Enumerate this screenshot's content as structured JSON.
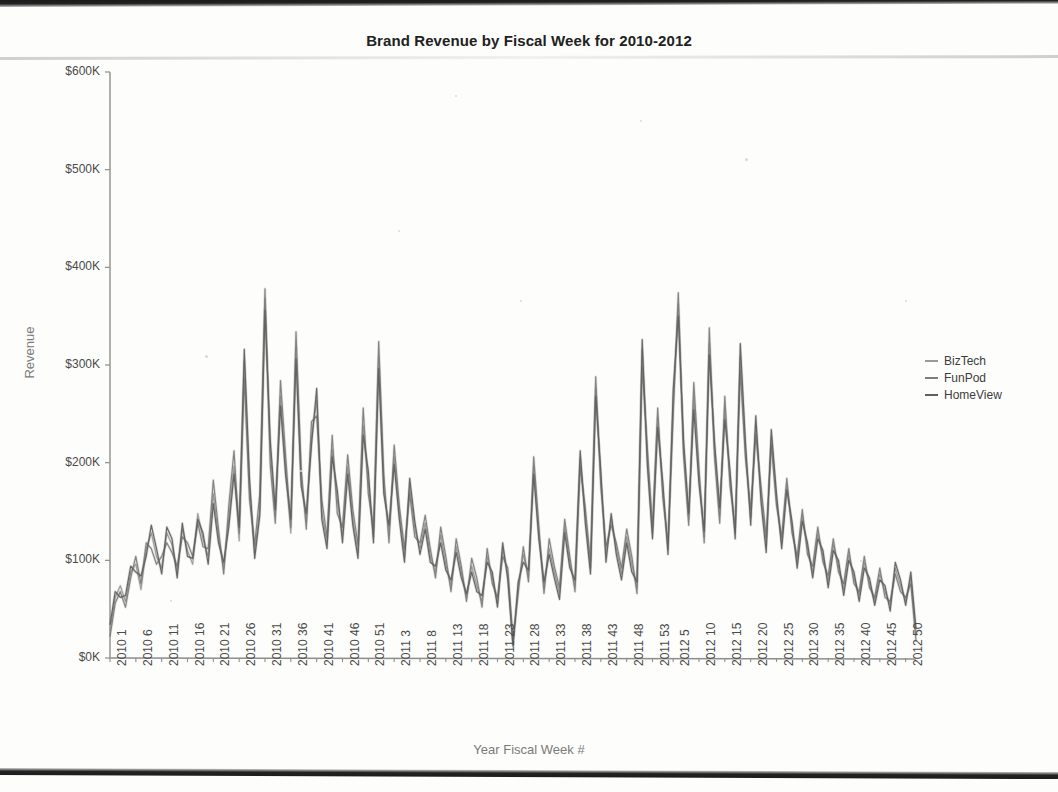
{
  "chart_data": {
    "type": "line",
    "title": "Brand Revenue by Fiscal Week for 2010-2012",
    "xlabel": "Year Fiscal Week #",
    "ylabel": "Revenue",
    "ylim": [
      0,
      600000
    ],
    "ytick_labels": [
      "$600K",
      "$500K",
      "$400K",
      "$300K",
      "$200K",
      "$100K",
      "$0K"
    ],
    "ytick_values": [
      600000,
      500000,
      400000,
      300000,
      200000,
      100000,
      0
    ],
    "grid": false,
    "legend_position": "right",
    "xtick_labels": [
      "2010 1",
      "2010 6",
      "2010 11",
      "2010 16",
      "2010 21",
      "2010 26",
      "2010 31",
      "2010 36",
      "2010 41",
      "2010 46",
      "2010 51",
      "2011 3",
      "2011 8",
      "2011 13",
      "2011 18",
      "2011 23",
      "2011 28",
      "2011 33",
      "2011 38",
      "2011 43",
      "2011 48",
      "2011 53",
      "2012 5",
      "2012 10",
      "2012 15",
      "2012 20",
      "2012 25",
      "2012 30",
      "2012 35",
      "2012 40",
      "2012 45",
      "2012 50"
    ],
    "xtick_indices": [
      0,
      5,
      10,
      15,
      20,
      25,
      30,
      35,
      40,
      45,
      50,
      55,
      60,
      65,
      70,
      75,
      80,
      85,
      90,
      95,
      100,
      105,
      109,
      114,
      119,
      124,
      129,
      134,
      139,
      144,
      149,
      154
    ],
    "n_points": 157,
    "series": [
      {
        "name": "BizTech",
        "color": "#9a9a9a",
        "values": [
          28000,
          62000,
          74000,
          58000,
          88000,
          96000,
          70000,
          112000,
          128000,
          104000,
          92000,
          128000,
          116000,
          88000,
          132000,
          110000,
          96000,
          148000,
          122000,
          104000,
          168000,
          124000,
          92000,
          142000,
          196000,
          120000,
          304000,
          176000,
          108000,
          152000,
          368000,
          214000,
          146000,
          268000,
          194000,
          128000,
          318000,
          182000,
          140000,
          226000,
          264000,
          150000,
          118000,
          214000,
          162000,
          126000,
          196000,
          142000,
          108000,
          238000,
          180000,
          124000,
          308000,
          176000,
          128000,
          206000,
          148000,
          104000,
          176000,
          132000,
          112000,
          138000,
          104000,
          88000,
          126000,
          96000,
          74000,
          114000,
          88000,
          62000,
          94000,
          74000,
          58000,
          104000,
          82000,
          56000,
          112000,
          86000,
          14000,
          72000,
          106000,
          84000,
          196000,
          128000,
          72000,
          112000,
          88000,
          66000,
          134000,
          98000,
          74000,
          204000,
          146000,
          92000,
          276000,
          184000,
          106000,
          142000,
          112000,
          86000,
          124000,
          96000,
          72000,
          316000,
          208000,
          128000,
          246000,
          172000,
          112000,
          262000,
          362000,
          216000,
          142000,
          268000,
          186000,
          124000,
          322000,
          214000,
          146000,
          256000,
          184000,
          128000,
          308000,
          212000,
          144000,
          238000,
          168000,
          116000,
          226000,
          162000,
          118000,
          178000,
          134000,
          98000,
          146000,
          112000,
          88000,
          128000,
          104000,
          78000,
          116000,
          94000,
          70000,
          106000,
          82000,
          64000,
          98000,
          76000,
          58000,
          86000,
          68000,
          54000,
          92000,
          74000,
          58000,
          82000,
          24000
        ]
      },
      {
        "name": "FunPod",
        "color": "#7d7d7d",
        "values": [
          22000,
          56000,
          68000,
          52000,
          82000,
          104000,
          76000,
          118000,
          112000,
          96000,
          104000,
          118000,
          108000,
          94000,
          124000,
          118000,
          104000,
          138000,
          114000,
          112000,
          182000,
          132000,
          86000,
          156000,
          212000,
          128000,
          286000,
          162000,
          116000,
          168000,
          378000,
          198000,
          138000,
          284000,
          206000,
          134000,
          334000,
          194000,
          132000,
          242000,
          248000,
          162000,
          124000,
          228000,
          148000,
          134000,
          208000,
          152000,
          116000,
          256000,
          168000,
          132000,
          324000,
          188000,
          118000,
          218000,
          156000,
          112000,
          168000,
          124000,
          118000,
          146000,
          112000,
          82000,
          134000,
          104000,
          68000,
          122000,
          94000,
          58000,
          102000,
          82000,
          52000,
          112000,
          76000,
          62000,
          104000,
          92000,
          18000,
          66000,
          114000,
          78000,
          206000,
          136000,
          66000,
          122000,
          94000,
          72000,
          142000,
          104000,
          68000,
          196000,
          154000,
          98000,
          288000,
          176000,
          114000,
          136000,
          118000,
          92000,
          132000,
          104000,
          66000,
          298000,
          216000,
          134000,
          256000,
          164000,
          118000,
          248000,
          374000,
          208000,
          136000,
          282000,
          194000,
          118000,
          338000,
          206000,
          138000,
          268000,
          176000,
          134000,
          294000,
          204000,
          152000,
          228000,
          176000,
          124000,
          218000,
          156000,
          124000,
          184000,
          128000,
          104000,
          152000,
          106000,
          94000,
          134000,
          98000,
          84000,
          122000,
          88000,
          76000,
          112000,
          76000,
          68000,
          104000,
          72000,
          62000,
          92000,
          62000,
          58000,
          86000,
          68000,
          62000,
          76000,
          18000
        ]
      },
      {
        "name": "HomeView",
        "color": "#606060",
        "values": [
          34000,
          68000,
          62000,
          64000,
          94000,
          88000,
          84000,
          104000,
          136000,
          112000,
          86000,
          134000,
          122000,
          82000,
          138000,
          104000,
          102000,
          142000,
          128000,
          96000,
          158000,
          118000,
          98000,
          134000,
          188000,
          134000,
          316000,
          184000,
          102000,
          146000,
          356000,
          224000,
          152000,
          258000,
          186000,
          142000,
          306000,
          176000,
          148000,
          218000,
          276000,
          142000,
          112000,
          206000,
          172000,
          118000,
          188000,
          136000,
          102000,
          228000,
          192000,
          118000,
          296000,
          168000,
          136000,
          198000,
          142000,
          98000,
          184000,
          140000,
          106000,
          132000,
          98000,
          94000,
          118000,
          90000,
          80000,
          108000,
          82000,
          66000,
          88000,
          68000,
          64000,
          98000,
          88000,
          52000,
          118000,
          80000,
          12000,
          78000,
          98000,
          90000,
          188000,
          122000,
          78000,
          106000,
          82000,
          60000,
          128000,
          92000,
          80000,
          212000,
          138000,
          86000,
          268000,
          192000,
          98000,
          148000,
          106000,
          80000,
          118000,
          88000,
          78000,
          326000,
          198000,
          122000,
          236000,
          180000,
          106000,
          274000,
          350000,
          224000,
          148000,
          254000,
          178000,
          130000,
          310000,
          222000,
          154000,
          244000,
          192000,
          122000,
          322000,
          220000,
          136000,
          248000,
          160000,
          108000,
          234000,
          168000,
          112000,
          172000,
          140000,
          92000,
          140000,
          118000,
          82000,
          122000,
          110000,
          72000,
          110000,
          100000,
          64000,
          100000,
          88000,
          58000,
          92000,
          82000,
          54000,
          80000,
          74000,
          48000,
          98000,
          80000,
          54000,
          88000,
          30000
        ]
      }
    ],
    "annotations": {
      "max_peak_value": 552000,
      "max_peak_label": "2012 32"
    }
  },
  "legend": {
    "items": [
      {
        "label": "BizTech",
        "color": "#9a9a9a"
      },
      {
        "label": "FunPod",
        "color": "#7d7d7d"
      },
      {
        "label": "HomeView",
        "color": "#606060"
      }
    ]
  }
}
